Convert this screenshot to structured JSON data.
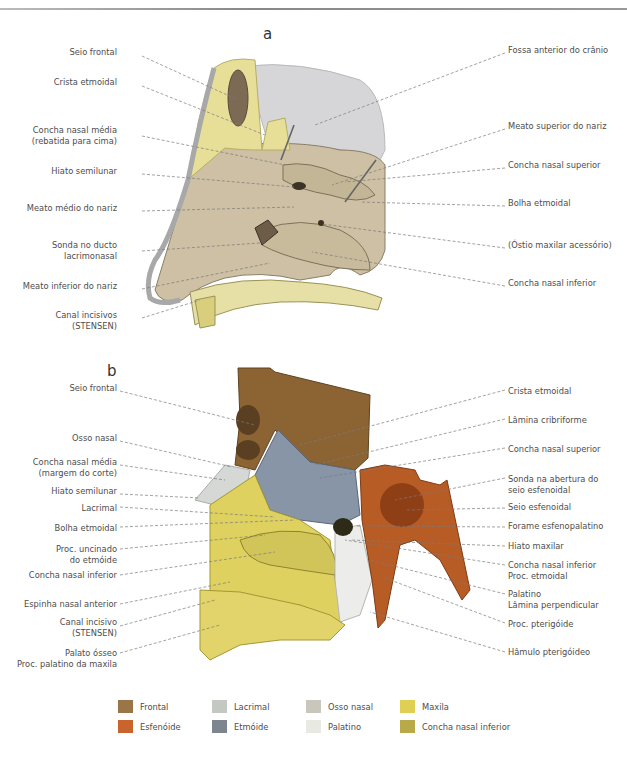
{
  "panel_a": {
    "letter": "a",
    "labels_left": [
      {
        "text": "Seio frontal",
        "x": 140,
        "y": 52
      },
      {
        "text": "Crista etmoidal",
        "x": 140,
        "y": 82
      },
      {
        "text": "Concha nasal média",
        "line2": "(rebatida para cima)",
        "x": 140,
        "y": 129
      },
      {
        "text": "Hiato semilunar",
        "x": 140,
        "y": 170
      },
      {
        "text": "Meato médio do nariz",
        "x": 140,
        "y": 207
      },
      {
        "text": "Sonda no ducto",
        "line2": "lacrimonasal",
        "x": 140,
        "y": 244
      },
      {
        "text": "Meato inferior do nariz",
        "x": 140,
        "y": 285
      },
      {
        "text": "Canal incisivos",
        "line2": "(STENSEN)",
        "x": 140,
        "y": 314
      }
    ],
    "labels_right": [
      {
        "text": "Fossa anterior do crânio",
        "x": 508,
        "y": 49
      },
      {
        "text": "Meato superior do nariz",
        "x": 508,
        "y": 125
      },
      {
        "text": "Concha nasal superior",
        "x": 508,
        "y": 164
      },
      {
        "text": "Bolha etmoidal",
        "x": 508,
        "y": 202
      },
      {
        "text": "(Óstio maxilar acessório)",
        "x": 508,
        "y": 244
      },
      {
        "text": "Concha nasal inferior",
        "x": 508,
        "y": 282
      }
    ]
  },
  "panel_b": {
    "letter": "b",
    "labels_left": [
      {
        "text": "Seio frontal",
        "x": 118,
        "y": 387
      },
      {
        "text": "Osso nasal",
        "x": 118,
        "y": 437
      },
      {
        "text": "Concha nasal média",
        "line2": "(margem do corte)",
        "x": 118,
        "y": 461
      },
      {
        "text": "Hiato semilunar",
        "x": 118,
        "y": 490
      },
      {
        "text": "Lacrimal",
        "x": 118,
        "y": 503
      },
      {
        "text": "Bolha etmoidal",
        "x": 118,
        "y": 523
      },
      {
        "text": "Proc. uncinado",
        "line2": "do etmóide",
        "x": 118,
        "y": 545
      },
      {
        "text": "Concha nasal inferior",
        "x": 118,
        "y": 571
      },
      {
        "text": "Espinha nasal anterior",
        "x": 118,
        "y": 600
      },
      {
        "text": "Canal incisivo",
        "line2": "(STENSEN)",
        "x": 118,
        "y": 622
      },
      {
        "text": "Palato ósseo",
        "line2": "Proc. palatino da maxila",
        "x": 118,
        "y": 649
      }
    ],
    "labels_right": [
      {
        "text": "Crista etmoidal",
        "x": 508,
        "y": 386
      },
      {
        "text": "Lâmina cribriforme",
        "x": 508,
        "y": 415
      },
      {
        "text": "Concha nasal superior",
        "x": 508,
        "y": 444
      },
      {
        "text": "Sonda na abertura do",
        "line2": "seio esfenoidal",
        "x": 508,
        "y": 474
      },
      {
        "text": "Seio esfenoidal",
        "x": 508,
        "y": 504
      },
      {
        "text": "Forame esfenopalatino",
        "x": 508,
        "y": 523
      },
      {
        "text": "Hiato maxilar",
        "x": 508,
        "y": 542
      },
      {
        "text": "Concha nasal inferior",
        "line2": "Proc. etmoidal",
        "x": 508,
        "y": 561
      },
      {
        "text": "Palatino",
        "line2": "Lâmina perpendicular",
        "x": 508,
        "y": 590
      },
      {
        "text": "Proc. pterigóide",
        "x": 508,
        "y": 619
      },
      {
        "text": "Hâmulo pterigóideo",
        "x": 508,
        "y": 648
      }
    ]
  },
  "legend": {
    "items": [
      {
        "label": "Frontal",
        "color": "#9a7548"
      },
      {
        "label": "Esfenóide",
        "color": "#c8642c"
      },
      {
        "label": "Lacrimal",
        "color": "#c3c8c3"
      },
      {
        "label": "Etmóide",
        "color": "#7d8590"
      },
      {
        "label": "Osso nasal",
        "color": "#c9c6bb"
      },
      {
        "label": "Palatino",
        "color": "#e9e9e4"
      },
      {
        "label": "Maxila",
        "color": "#e0cf55"
      },
      {
        "label": "Concha nasal inferior",
        "color": "#b8aa48"
      }
    ]
  },
  "colors": {
    "bone_yellow": "#e8e09a",
    "mucosa": "#cfc3a8",
    "cranial_fossa": "#d8d8d8",
    "frontal": "#8a6232",
    "sphenoid": "#b85a24",
    "ethmoid": "#8593a3",
    "maxilla": "#ddd061",
    "palatine": "#ececea",
    "leader_line": "#777777"
  }
}
